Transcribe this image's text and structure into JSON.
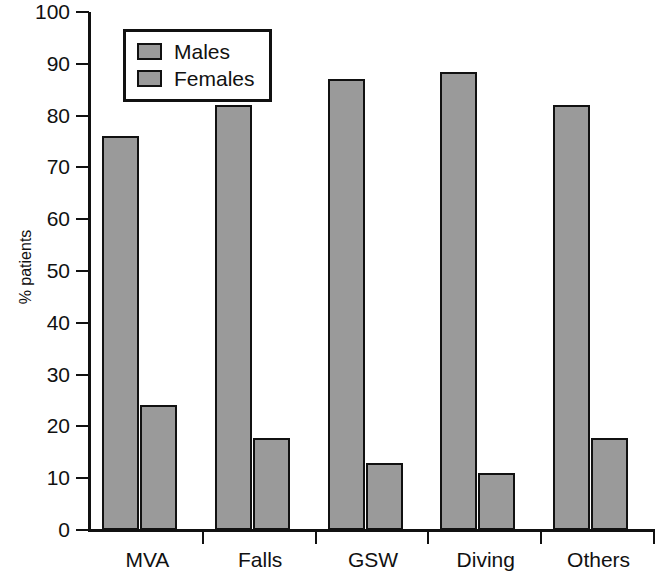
{
  "chart_data": {
    "type": "bar",
    "title": "",
    "xlabel": "",
    "ylabel": "% patients",
    "ylim": [
      0,
      100
    ],
    "yticks": [
      0,
      10,
      20,
      30,
      40,
      50,
      60,
      70,
      80,
      90,
      100
    ],
    "ytick_labels": [
      "0",
      "10",
      "20",
      "30",
      "40",
      "50",
      "60",
      "70",
      "80",
      "90",
      "100"
    ],
    "grid": false,
    "legend_position": "top-left",
    "categories": [
      "MVA",
      "Falls",
      "GSW",
      "Diving",
      "Others"
    ],
    "series": [
      {
        "name": "Males",
        "values": [
          76,
          82,
          87,
          88.5,
          82
        ]
      },
      {
        "name": "Females",
        "values": [
          24.2,
          17.8,
          12.9,
          11,
          17.7
        ]
      }
    ],
    "bar_color": "#9a9a9a",
    "bar_edge_color": "#111111"
  },
  "legend": {
    "entries": [
      {
        "label": "Males"
      },
      {
        "label": "Females"
      }
    ]
  }
}
